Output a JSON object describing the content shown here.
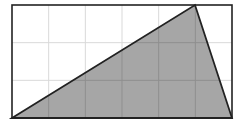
{
  "diagram": {
    "type": "grid-triangle",
    "grid": {
      "columns": 6,
      "rows": 3
    },
    "rect": {
      "x": 12,
      "y": 5,
      "width": 220,
      "height": 113
    },
    "triangle": {
      "vertices_grid": [
        [
          0,
          0
        ],
        [
          5,
          3
        ],
        [
          6,
          0
        ]
      ],
      "vertices_px": [
        [
          12,
          118
        ],
        [
          195,
          5
        ],
        [
          232,
          118
        ]
      ]
    },
    "colors": {
      "fill": "#a6a6a6",
      "stroke": "#222222",
      "grid": "#d9d9d9",
      "background": "#ffffff"
    }
  }
}
